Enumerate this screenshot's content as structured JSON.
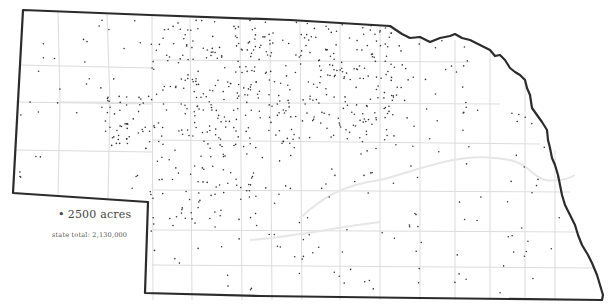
{
  "map": {
    "subject": "Nebraska dot-density map",
    "colors": {
      "background": "#ffffff",
      "state_border": "#2b2b2b",
      "county_lines": "#dcdcdc",
      "river_lines": "#e4e4e4",
      "dots": "#333333"
    },
    "dot_value_acres": 2500,
    "state_total_acres": 2130000
  },
  "legend": {
    "dot_symbol": "•",
    "dot_label": "2500 acres",
    "state_total_label": "state total:  2,130,000"
  },
  "density_regions": [
    {
      "name": "north-central-sandhills",
      "x": [
        150,
        300
      ],
      "y": [
        20,
        95
      ],
      "count": 150
    },
    {
      "name": "northeast-dense",
      "x": [
        300,
        395
      ],
      "y": [
        18,
        140
      ],
      "count": 170
    },
    {
      "name": "central-west",
      "x": [
        105,
        300
      ],
      "y": [
        95,
        150
      ],
      "count": 150
    },
    {
      "name": "southwest-central",
      "x": [
        150,
        260
      ],
      "y": [
        150,
        230
      ],
      "count": 75
    },
    {
      "name": "north-central-east",
      "x": [
        395,
        470
      ],
      "y": [
        40,
        130
      ],
      "count": 30
    },
    {
      "name": "panhandle-north",
      "x": [
        20,
        150
      ],
      "y": [
        20,
        110
      ],
      "count": 22
    },
    {
      "name": "panhandle-south",
      "x": [
        15,
        150
      ],
      "y": [
        110,
        195
      ],
      "count": 16
    },
    {
      "name": "central-south",
      "x": [
        260,
        420
      ],
      "y": [
        140,
        240
      ],
      "count": 40
    },
    {
      "name": "east",
      "x": [
        400,
        560
      ],
      "y": [
        110,
        300
      ],
      "count": 45
    },
    {
      "name": "south",
      "x": [
        150,
        420
      ],
      "y": [
        230,
        295
      ],
      "count": 30
    }
  ]
}
